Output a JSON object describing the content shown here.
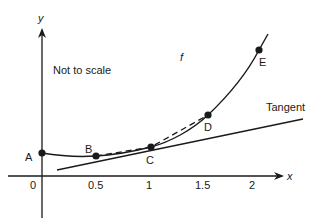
{
  "diagram": {
    "note": "Not to scale",
    "function_label": "f",
    "tangent_label": "Tangent",
    "axes": {
      "x_label": "x",
      "y_label": "y",
      "x_ticks": [
        "0",
        "0.5",
        "1",
        "1.5",
        "2"
      ]
    },
    "points": [
      {
        "id": "A",
        "label": "A",
        "x_value": "0"
      },
      {
        "id": "B",
        "label": "B",
        "x_value": "0.5"
      },
      {
        "id": "C",
        "label": "C",
        "x_value": "1"
      },
      {
        "id": "D",
        "label": "D",
        "x_value": "1.5"
      },
      {
        "id": "E",
        "label": "E",
        "x_value": "2"
      }
    ],
    "colors": {
      "stroke": "#1a1a1a",
      "background": "#ffffff"
    }
  }
}
